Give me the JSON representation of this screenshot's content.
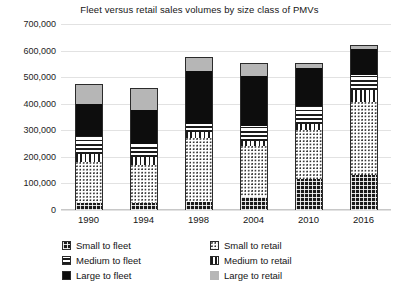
{
  "chart_data": {
    "type": "bar",
    "subtype": "stacked",
    "title": "Fleet versus retail sales volumes by size class of PMVs",
    "xlabel": "",
    "ylabel": "",
    "ylim": [
      0,
      700000
    ],
    "ytick_step": 100000,
    "grid": true,
    "legend_position": "bottom",
    "categories": [
      "1990",
      "1994",
      "1998",
      "2004",
      "2010",
      "2016"
    ],
    "ytick_labels": [
      "700,000",
      "600,000",
      "500,000",
      "400,000",
      "300,000",
      "200,000",
      "100,000",
      "0"
    ],
    "ytick_values": [
      700000,
      600000,
      500000,
      400000,
      300000,
      200000,
      100000,
      0
    ],
    "series": [
      {
        "name": "Small to fleet",
        "key": "small-fleet",
        "pattern": "cross-hatch-dark",
        "values": [
          25000,
          25000,
          30000,
          50000,
          115000,
          130000
        ]
      },
      {
        "name": "Small to retail",
        "key": "small-retail",
        "pattern": "fine-dots",
        "values": [
          155000,
          145000,
          240000,
          190000,
          185000,
          275000
        ]
      },
      {
        "name": "Medium to retail",
        "key": "medium-retail",
        "pattern": "vertical-lines",
        "values": [
          30000,
          30000,
          25000,
          20000,
          25000,
          45000
        ]
      },
      {
        "name": "Medium to fleet",
        "key": "medium-fleet",
        "pattern": "horizontal-lines",
        "values": [
          70000,
          50000,
          30000,
          55000,
          65000,
          60000
        ]
      },
      {
        "name": "Large to fleet",
        "key": "large-fleet",
        "pattern": "solid-black",
        "values": [
          120000,
          125000,
          200000,
          190000,
          145000,
          95000
        ]
      },
      {
        "name": "Large to retail",
        "key": "large-retail",
        "pattern": "solid-grey",
        "values": [
          75000,
          85000,
          50000,
          50000,
          20000,
          15000
        ]
      }
    ],
    "stack_order_bottom_to_top": [
      "small-fleet",
      "small-retail",
      "medium-retail",
      "medium-fleet",
      "large-fleet",
      "large-retail"
    ],
    "totals": [
      475000,
      460000,
      575000,
      555000,
      555000,
      620000
    ],
    "colors": {
      "dark": "#1b1b1b",
      "black": "#0d0d0d",
      "grey": "#b6b6b6",
      "gridline": "#e2e2e2",
      "text": "#161616",
      "background": "#ffffff"
    }
  },
  "legend": {
    "items": [
      {
        "label": "Small to fleet",
        "key": "small-fleet",
        "column": 0,
        "row": 0
      },
      {
        "label": "Medium to fleet",
        "key": "medium-fleet",
        "column": 0,
        "row": 1
      },
      {
        "label": "Large to fleet",
        "key": "large-fleet",
        "column": 0,
        "row": 2
      },
      {
        "label": "Small to retail",
        "key": "small-retail",
        "column": 1,
        "row": 0
      },
      {
        "label": "Medium to retail",
        "key": "medium-retail",
        "column": 1,
        "row": 1
      },
      {
        "label": "Large to retail",
        "key": "large-retail",
        "column": 1,
        "row": 2
      }
    ]
  }
}
